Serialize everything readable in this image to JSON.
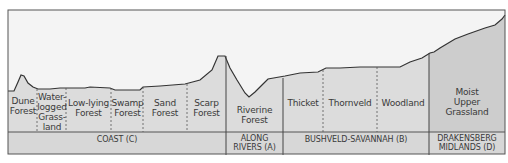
{
  "diagram": {
    "type": "vegetation-profile-cross-section",
    "colors": {
      "sky": "#f4f4f4",
      "land": "#dcdcdc",
      "land_dark": "#c9c9c9",
      "region_band": "#d7d7d7",
      "line": "#333333",
      "text": "#3a3a3a"
    },
    "zones": [
      {
        "id": "dune-forest",
        "label": "Dune Forest",
        "region": "coast"
      },
      {
        "id": "waterlogged-grassland",
        "label": "Water-logged Grass-land",
        "region": "coast"
      },
      {
        "id": "low-lying-forest",
        "label": "Low-lying Forest",
        "region": "coast"
      },
      {
        "id": "swamp-forest",
        "label": "Swamp Forest",
        "region": "coast"
      },
      {
        "id": "sand-forest",
        "label": "Sand Forest",
        "region": "coast"
      },
      {
        "id": "scarp-forest",
        "label": "Scarp Forest",
        "region": "coast"
      },
      {
        "id": "riverine-forest",
        "label": "Riverine Forest",
        "region": "rivers"
      },
      {
        "id": "thicket",
        "label": "Thicket",
        "region": "bushveld"
      },
      {
        "id": "thornveld",
        "label": "Thornveld",
        "region": "bushveld"
      },
      {
        "id": "woodland",
        "label": "Woodland",
        "region": "bushveld"
      },
      {
        "id": "moist-upper-grassland",
        "label": "Moist Upper Grassland",
        "region": "drakensberg"
      }
    ],
    "zone_text": {
      "dune_1": "Dune",
      "dune_2": "Forest",
      "water_1": "Water-",
      "water_2": "logged",
      "water_3": "Grass-",
      "water_4": "land",
      "low_1": "Low-lying",
      "low_2": "Forest",
      "swamp_1": "Swamp",
      "swamp_2": "Forest",
      "sand_1": "Sand",
      "sand_2": "Forest",
      "scarp_1": "Scarp",
      "scarp_2": "Forest",
      "riv_1": "Riverine",
      "riv_2": "Forest",
      "thicket": "Thicket",
      "thornveld": "Thornveld",
      "woodland": "Woodland",
      "moist_1": "Moist",
      "moist_2": "Upper",
      "moist_3": "Grassland"
    },
    "regions": {
      "coast": "COAST (C)",
      "rivers_1": "ALONG",
      "rivers_2": "RIVERS (A)",
      "bushveld": "BUSHVELD-SAVANNAH (B)",
      "drak_1": "DRAKENSBERG",
      "drak_2": "MIDLANDS (D)"
    }
  }
}
